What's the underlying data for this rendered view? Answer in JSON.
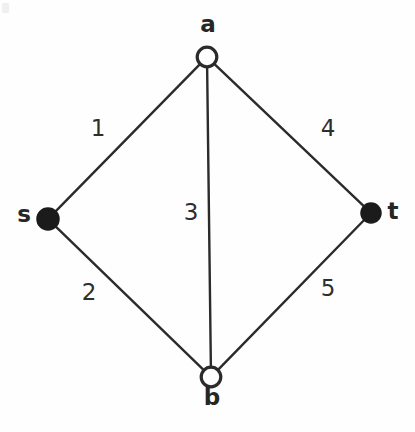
{
  "figure": {
    "background_color": "#fefefe",
    "edge_color": "#2b2b2b",
    "node_fill_solid": "#1b1b1b",
    "node_fill_open": "#ffffff",
    "label_color": "#262626"
  },
  "nodes": [
    {
      "id": "a",
      "label": "a",
      "x": 207,
      "y": 57,
      "r": 11,
      "style": "open",
      "label_x": 208,
      "label_y": 32,
      "label_anchor": "middle"
    },
    {
      "id": "s",
      "label": "s",
      "x": 48,
      "y": 219,
      "r": 11,
      "style": "filled",
      "label_x": 24,
      "label_y": 222,
      "label_anchor": "middle"
    },
    {
      "id": "t",
      "label": "t",
      "x": 371,
      "y": 213,
      "r": 10,
      "style": "filled",
      "label_x": 393,
      "label_y": 219,
      "label_anchor": "middle"
    },
    {
      "id": "b",
      "label": "b",
      "x": 211,
      "y": 377,
      "r": 11,
      "style": "open",
      "label_x": 212,
      "label_y": 405,
      "label_anchor": "middle"
    }
  ],
  "edges": [
    {
      "id": "s-a",
      "from": "s",
      "to": "a",
      "weight": "1",
      "label_x": 98,
      "label_y": 136
    },
    {
      "id": "s-b",
      "from": "s",
      "to": "b",
      "weight": "2",
      "label_x": 89,
      "label_y": 300
    },
    {
      "id": "a-b",
      "from": "a",
      "to": "b",
      "weight": "3",
      "label_x": 191,
      "label_y": 220
    },
    {
      "id": "a-t",
      "from": "a",
      "to": "t",
      "weight": "4",
      "label_x": 328,
      "label_y": 136
    },
    {
      "id": "b-t",
      "from": "b",
      "to": "t",
      "weight": "5",
      "label_x": 328,
      "label_y": 296
    }
  ]
}
